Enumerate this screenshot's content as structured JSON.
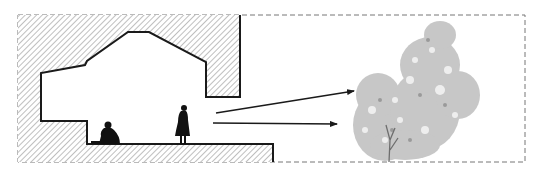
{
  "diagram": {
    "type": "architectural-section",
    "frame": {
      "x1": 18,
      "y1": 15,
      "x2": 525,
      "y2": 162,
      "style": "dashed"
    },
    "colors": {
      "line": "#1a1a1a",
      "hatch": "#8a8a8a",
      "frame": "#777777",
      "tree": "#9a9a9a",
      "tree_dark": "#6e6e6e",
      "background": "#ffffff"
    },
    "elements": [
      {
        "id": "solid-mass",
        "kind": "hatched-section",
        "label": ""
      },
      {
        "id": "seated-figure",
        "kind": "silhouette",
        "label": ""
      },
      {
        "id": "standing-figure",
        "kind": "silhouette",
        "label": ""
      },
      {
        "id": "sight-line-upper",
        "kind": "arrow",
        "from": [
          216,
          113
        ],
        "to": [
          354,
          91
        ]
      },
      {
        "id": "sight-line-lower",
        "kind": "arrow",
        "from": [
          213,
          123
        ],
        "to": [
          337,
          124
        ]
      },
      {
        "id": "tree",
        "kind": "vegetation",
        "label": ""
      }
    ]
  }
}
